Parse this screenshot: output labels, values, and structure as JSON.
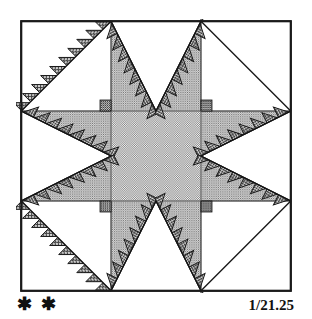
{
  "figure": {
    "kind": "quilt-block-diagram",
    "block_name": "Feathered Star",
    "difficulty_rating": "✱ ✱",
    "difficulty_stars": 2,
    "block_number": "1/21.25"
  },
  "colors": {
    "ink": "#111111",
    "outline": "#1a1a1a",
    "background": "#ffffff",
    "seam_line": "#6b6b6b",
    "center_fill": "#b9b9b9",
    "point_fill": "#a8a8a8",
    "feather_fill": "#8a8a8a",
    "white_fill": "#ffffff"
  },
  "block": {
    "frame_label": "block-border",
    "grid_units": 12,
    "regions": [
      {
        "name": "corner-square-top-left",
        "fill": "white"
      },
      {
        "name": "corner-square-top-right",
        "fill": "white"
      },
      {
        "name": "corner-square-bottom-left",
        "fill": "white"
      },
      {
        "name": "corner-square-bottom-right",
        "fill": "white"
      },
      {
        "name": "center-square",
        "fill": "center_fill"
      },
      {
        "name": "star-point-north",
        "fill": "point_fill"
      },
      {
        "name": "star-point-south",
        "fill": "point_fill"
      },
      {
        "name": "star-point-east",
        "fill": "point_fill"
      },
      {
        "name": "star-point-west",
        "fill": "point_fill"
      },
      {
        "name": "star-point-northeast",
        "fill": "point_fill"
      },
      {
        "name": "star-point-northwest",
        "fill": "point_fill"
      },
      {
        "name": "star-point-southeast",
        "fill": "point_fill"
      },
      {
        "name": "star-point-southwest",
        "fill": "point_fill"
      },
      {
        "name": "feather-sawtooth-band",
        "fill": "feather_fill"
      }
    ]
  }
}
